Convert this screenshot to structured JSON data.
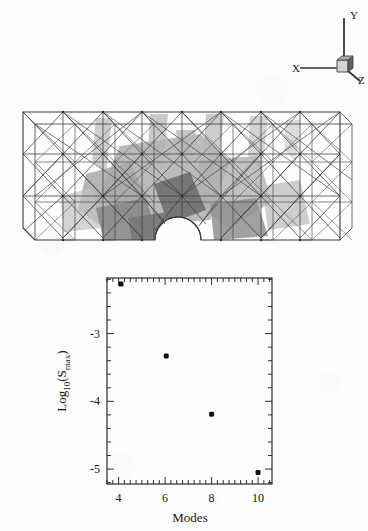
{
  "page": {
    "background_color": "#fdfdfc",
    "ink_color": "#1a1a1a"
  },
  "triad": {
    "name": "coordinate-axis-triad",
    "axes": [
      {
        "label": "Y",
        "direction": "up"
      },
      {
        "label": "X",
        "direction": "left"
      },
      {
        "label": "Z",
        "direction": "down-right"
      }
    ],
    "origin_cube": {
      "front_face_color": "#d2d2d2",
      "side_face_color": "#6e6e6e",
      "top_face_color": "#b5b5b5"
    }
  },
  "mesh": {
    "name": "finite-element-truss-mesh",
    "description": "3D wireframe box-truss finite element mesh shown in perspective with a semicircular notch cut into the bottom center and grey shaded deformation/stress patches visible through the wireframe",
    "wireframe_color": "#3a3a3a",
    "shade_color": "#b9b9b9",
    "shade_dark_color": "#7c7c7c",
    "bays_x": 8,
    "bays_y": 3,
    "notch": {
      "shape": "semicircle",
      "center_x": 178,
      "radius": 23
    }
  },
  "chart_data": {
    "type": "scatter",
    "title": "",
    "xlabel": "Modes",
    "ylabel": "Log10(Smax)",
    "ylabel_parts": {
      "base": "Log",
      "base_subscript": "10",
      "open_paren": "(",
      "symbol": "S",
      "symbol_subscript": "max",
      "close_paren": ")"
    },
    "x": [
      4.1,
      6.05,
      8.0,
      10.0
    ],
    "y": [
      -2.27,
      -3.33,
      -4.19,
      -5.05
    ],
    "points": [
      {
        "x": 4.1,
        "y": -2.27
      },
      {
        "x": 6.05,
        "y": -3.33
      },
      {
        "x": 8.0,
        "y": -4.19
      },
      {
        "x": 10.0,
        "y": -5.05
      }
    ],
    "xlim": [
      3.5,
      10.6
    ],
    "ylim": [
      -5.22,
      -2.18
    ],
    "xticks": [
      4,
      6,
      8,
      10
    ],
    "xtick_labels": [
      "4",
      "6",
      "8",
      "10"
    ],
    "yticks": [
      -3,
      -4,
      -5
    ],
    "ytick_labels": [
      "-3",
      "-4",
      "-5"
    ],
    "x_minor_tick_step": 0.25,
    "y_minor_tick_step": 0.2,
    "grid": false,
    "legend": null,
    "frame": "box",
    "tick_direction": "in",
    "marker": {
      "shape": "filled-square-circle",
      "color": "#111111",
      "size_px": 5
    }
  }
}
